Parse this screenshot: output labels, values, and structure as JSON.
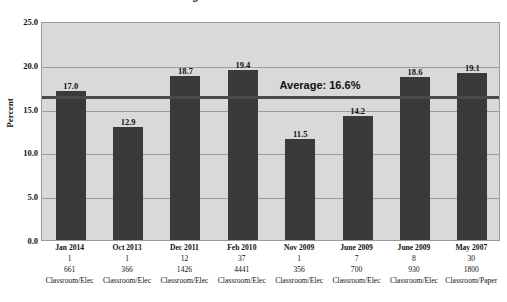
{
  "chart_data": {
    "type": "bar",
    "title": "Eight Different Studies 2007-2014",
    "title_line1": "",
    "title_line2": "Eight Different Studies 2007-2014",
    "xlabel": "",
    "ylabel": "Percent",
    "ylim": [
      0,
      25
    ],
    "ytick_step": 5,
    "ytick_labels": [
      "0.0",
      "5.0",
      "10.0",
      "15.0",
      "20.0",
      "25.0"
    ],
    "ytick_values": [
      0,
      5,
      10,
      15,
      20,
      25
    ],
    "grid": true,
    "legend": "none",
    "categories": [
      "Jan 2014",
      "Oct 2013",
      "Dec 2011",
      "Feb 2010",
      "Nov 2009",
      "June 2009",
      "June 2009",
      "May 2007"
    ],
    "values": [
      17.0,
      12.9,
      18.7,
      19.4,
      11.5,
      14.2,
      18.6,
      19.1
    ],
    "data_labels": [
      "17.0",
      "12.9",
      "18.7",
      "19.4",
      "11.5",
      "14.2",
      "18.6",
      "19.1"
    ],
    "tick_rows": {
      "row2_label": "",
      "row2": [
        "1",
        "1",
        "12",
        "37",
        "1",
        "7",
        "8",
        "30"
      ],
      "row3_label": "",
      "row3": [
        "661",
        "366",
        "1426",
        "4441",
        "356",
        "700",
        "930",
        "1800"
      ],
      "row4_label": "",
      "row4": [
        "Classroom/Elec",
        "Classroom/Elec",
        "Classroom/Elec",
        "Classroom/Elec",
        "Classroom/Elec",
        "Classroom/Elec",
        "Classroom/Elec",
        "Classroom/Paper"
      ]
    },
    "annotations": [
      {
        "name": "average-line",
        "text": "Average: 16.6%",
        "value": 16.6
      }
    ],
    "colors": {
      "bar": "#3a3a3a",
      "plot_background": "#d9d9d9",
      "gridline": "#9d9d9d",
      "average_line": "#4a4a4a",
      "text": "#111111",
      "page_background": "#ffffff"
    }
  }
}
